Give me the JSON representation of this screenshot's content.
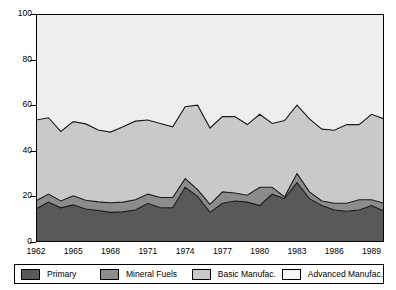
{
  "chart_data": {
    "type": "area",
    "stacked": true,
    "title": "",
    "xlabel": "",
    "ylabel": "",
    "ylim": [
      0,
      100
    ],
    "yticks": [
      0,
      20,
      40,
      60,
      80,
      100
    ],
    "grid": false,
    "legend_position": "bottom",
    "x": [
      1962,
      1963,
      1964,
      1965,
      1966,
      1967,
      1968,
      1969,
      1970,
      1971,
      1972,
      1973,
      1974,
      1975,
      1976,
      1977,
      1978,
      1979,
      1980,
      1981,
      1982,
      1983,
      1984,
      1985,
      1986,
      1987,
      1988,
      1989,
      1990
    ],
    "xtick_labels": [
      "1962",
      "1965",
      "1968",
      "1971",
      "1974",
      "1977",
      "1980",
      "1983",
      "1986",
      "1989"
    ],
    "xtick_values": [
      1962,
      1965,
      1968,
      1971,
      1974,
      1977,
      1980,
      1983,
      1986,
      1989
    ],
    "series": [
      {
        "name": "Primary",
        "color": "#595959",
        "values": [
          14.5,
          17.5,
          15.0,
          16.3,
          14.5,
          13.8,
          13.0,
          13.2,
          14.0,
          17.0,
          15.0,
          15.0,
          24.0,
          20.0,
          13.0,
          17.0,
          18.0,
          17.5,
          16.0,
          21.0,
          19.0,
          26.0,
          19.0,
          16.0,
          14.0,
          13.5,
          14.0,
          16.0,
          13.5
        ]
      },
      {
        "name": "Mineral Fuels",
        "color": "#8c8c8c",
        "values": [
          3.5,
          3.5,
          3.0,
          4.0,
          3.8,
          3.8,
          4.2,
          4.3,
          4.5,
          4.0,
          4.5,
          4.5,
          3.8,
          3.0,
          3.5,
          5.0,
          3.5,
          3.0,
          8.0,
          3.0,
          0.8,
          4.0,
          3.0,
          2.0,
          3.0,
          3.5,
          4.5,
          2.5,
          3.5
        ]
      },
      {
        "name": "Basic Manufac.",
        "color": "#c9c9c9",
        "values": [
          35.5,
          33.5,
          30.5,
          32.5,
          33.5,
          31.5,
          31.0,
          33.0,
          34.5,
          32.5,
          32.5,
          31.0,
          31.5,
          37.0,
          33.5,
          33.0,
          33.5,
          31.0,
          32.0,
          28.0,
          33.5,
          30.0,
          32.0,
          31.5,
          32.0,
          34.5,
          33.0,
          37.5,
          37.0
        ]
      },
      {
        "name": "Advanced Manufac.",
        "color": "#eeeeee",
        "values": [
          46.5,
          45.5,
          51.5,
          47.2,
          48.2,
          50.9,
          51.8,
          49.5,
          47.0,
          46.5,
          48.0,
          49.5,
          40.7,
          40.0,
          50.0,
          45.0,
          45.0,
          48.5,
          44.0,
          48.0,
          46.7,
          40.0,
          46.0,
          50.5,
          51.0,
          48.5,
          48.5,
          44.0,
          46.0
        ]
      }
    ]
  },
  "axes": {
    "y_ticks": [
      "0",
      "20",
      "40",
      "60",
      "80",
      "100"
    ]
  },
  "legend": {
    "items": [
      {
        "label": "Primary",
        "color": "#595959",
        "swatch": "primary-swatch"
      },
      {
        "label": "Mineral Fuels",
        "color": "#8c8c8c",
        "swatch": "mineral-fuels-swatch"
      },
      {
        "label": "Basic Manufac.",
        "color": "#c9c9c9",
        "swatch": "basic-manufac-swatch"
      },
      {
        "label": "Advanced Manufac.",
        "color": "#f4f4f4",
        "swatch": "advanced-manufac-swatch"
      }
    ]
  }
}
